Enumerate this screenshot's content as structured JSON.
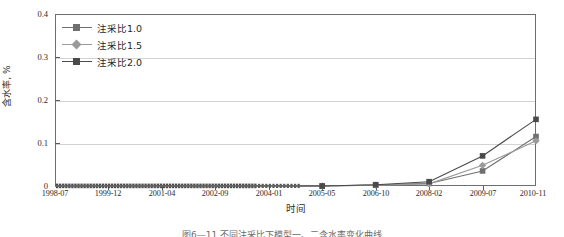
{
  "figure": {
    "caption": "图6—11 不同注采比下模型一、二含水率变化曲线"
  },
  "axes": {
    "y_title": "含水率, %",
    "x_title": "时间",
    "y_ticks": [
      "0",
      "0.1",
      "0.2",
      "0.3",
      "0.4"
    ],
    "x_ticks": [
      "1998-07",
      "1999-12",
      "2001-04",
      "2002-09",
      "2004-01",
      "2005-05",
      "2006-10",
      "2008-02",
      "2009-07",
      "2010-11"
    ]
  },
  "legend": {
    "items": [
      {
        "label": "注采比1.0",
        "marker": "square",
        "color": "#6f6f6f"
      },
      {
        "label": "注采比1.5",
        "marker": "diamond",
        "color": "#9a9a9a"
      },
      {
        "label": "注采比2.0",
        "marker": "square",
        "color": "#4a4a4a"
      }
    ]
  },
  "chart_data": {
    "type": "line",
    "title": "",
    "xlabel": "时间",
    "ylabel": "含水率, %",
    "ylim": [
      0,
      0.4
    ],
    "grid": true,
    "legend_position": "top-left",
    "x_tick_labels": [
      "1998-07",
      "1999-12",
      "2001-04",
      "2002-09",
      "2004-01",
      "2005-05",
      "2006-10",
      "2008-02",
      "2009-07",
      "2010-11"
    ],
    "x": [
      "1998-07",
      "1999-12",
      "2001-04",
      "2002-09",
      "2004-01",
      "2005-05",
      "2006-10",
      "2008-02",
      "2009-07",
      "2010-11"
    ],
    "series": [
      {
        "name": "注采比1.0",
        "color": "#6f6f6f",
        "marker": "square",
        "values": [
          0,
          0,
          0,
          0,
          0,
          0,
          0.002,
          0.006,
          0.035,
          0.115
        ]
      },
      {
        "name": "注采比1.5",
        "color": "#9a9a9a",
        "marker": "diamond",
        "values": [
          0,
          0,
          0,
          0,
          0,
          0,
          0.002,
          0.005,
          0.048,
          0.105
        ]
      },
      {
        "name": "注采比2.0",
        "color": "#4a4a4a",
        "marker": "square",
        "values": [
          0,
          0,
          0,
          0,
          0,
          0,
          0.003,
          0.01,
          0.07,
          0.155
        ]
      }
    ]
  }
}
